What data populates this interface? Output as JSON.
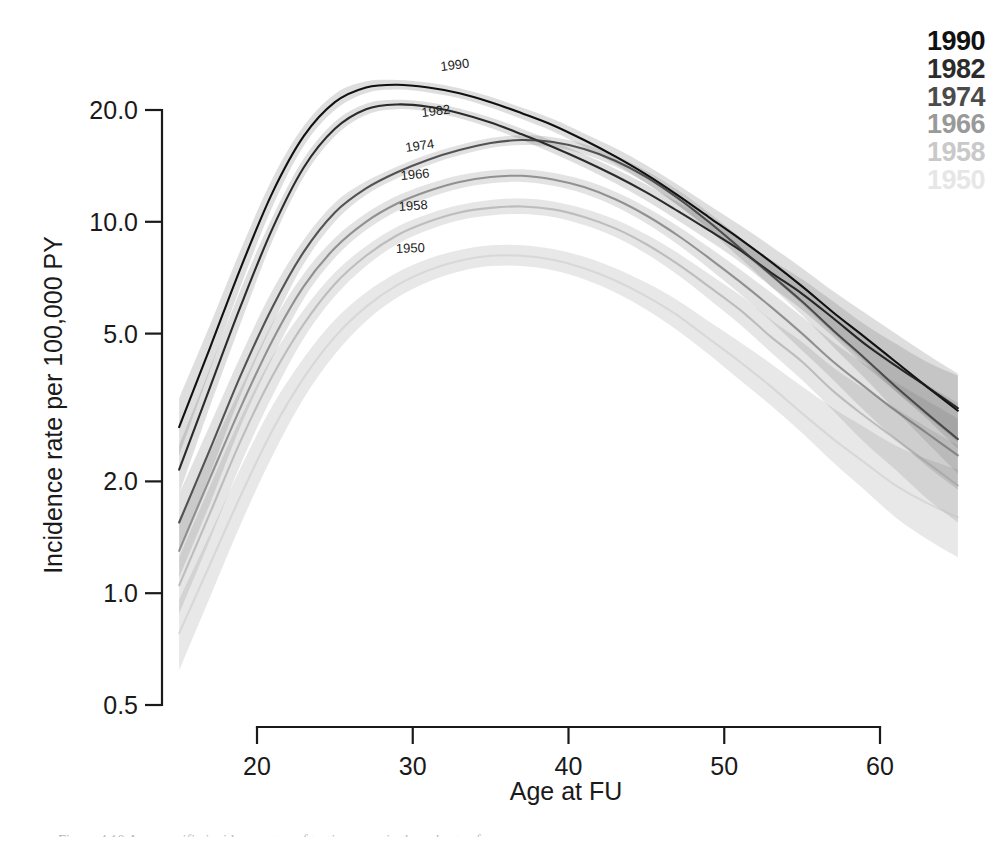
{
  "chart_data": {
    "type": "line",
    "title": "",
    "xlabel": "Age at FU",
    "ylabel": "Incidence rate per 100,000 PY",
    "yscale": "log",
    "xlim": [
      15,
      65
    ],
    "ylim": [
      0.5,
      26
    ],
    "grid": false,
    "legend_position": "top-right",
    "xticks": [
      20,
      30,
      40,
      50,
      60
    ],
    "xticklabels": [
      "20",
      "30",
      "40",
      "50",
      "60"
    ],
    "yticks": [
      0.5,
      1.0,
      2.0,
      5.0,
      10.0,
      20.0
    ],
    "yticklabels": [
      "0.5",
      "1.0",
      "2.0",
      "5.0",
      "10.0",
      "20.0"
    ],
    "band_description": "shaded grey 95% confidence bands around each curve",
    "series": [
      {
        "name": "1990",
        "color": "#111111",
        "opacity": 1.0,
        "x": [
          15,
          17,
          19,
          21,
          23,
          25,
          27,
          29,
          31,
          33,
          35,
          37,
          39,
          41,
          43,
          45,
          47,
          49,
          51,
          53,
          55,
          57,
          59,
          61,
          63,
          65
        ],
        "values": [
          2.8,
          4.6,
          7.6,
          12.0,
          17.0,
          21.0,
          23.0,
          23.4,
          23.0,
          22.2,
          21.0,
          19.6,
          18.2,
          16.6,
          15.0,
          13.4,
          11.8,
          10.3,
          9.0,
          7.8,
          6.7,
          5.7,
          4.9,
          4.2,
          3.6,
          3.1
        ],
        "ci_lower": [
          2.35,
          4.0,
          6.8,
          11.0,
          16.0,
          20.0,
          22.2,
          22.7,
          22.3,
          21.5,
          20.3,
          18.9,
          17.5,
          15.9,
          14.3,
          12.7,
          11.1,
          9.6,
          8.3,
          7.1,
          6.0,
          5.0,
          4.2,
          3.5,
          2.95,
          2.45
        ],
        "ci_upper": [
          3.35,
          5.3,
          8.5,
          13.1,
          18.1,
          22.1,
          23.9,
          24.1,
          23.7,
          22.9,
          21.7,
          20.3,
          18.9,
          17.3,
          15.8,
          14.2,
          12.6,
          11.1,
          9.8,
          8.6,
          7.5,
          6.5,
          5.7,
          5.0,
          4.4,
          3.9
        ]
      },
      {
        "name": "1982",
        "color": "#1b1b1b",
        "opacity": 0.92,
        "x": [
          15,
          17,
          19,
          21,
          23,
          25,
          27,
          29,
          31,
          33,
          35,
          37,
          39,
          41,
          43,
          45,
          47,
          49,
          51,
          53,
          55,
          57,
          59,
          61,
          63,
          65
        ],
        "values": [
          2.15,
          3.6,
          6.0,
          9.6,
          14.0,
          17.8,
          20.1,
          20.7,
          20.4,
          19.6,
          18.5,
          17.2,
          15.9,
          14.6,
          13.3,
          12.0,
          10.7,
          9.5,
          8.4,
          7.3,
          6.4,
          5.5,
          4.7,
          4.1,
          3.6,
          3.15
        ],
        "ci_lower": [
          1.85,
          3.2,
          5.4,
          8.9,
          13.2,
          17.0,
          19.4,
          20.1,
          19.8,
          19.0,
          17.9,
          16.6,
          15.3,
          14.0,
          12.7,
          11.4,
          10.1,
          8.9,
          7.8,
          6.7,
          5.8,
          4.9,
          4.1,
          3.5,
          3.0,
          2.55
        ],
        "ci_upper": [
          2.5,
          4.05,
          6.65,
          10.3,
          14.8,
          18.6,
          20.8,
          21.3,
          21.0,
          20.2,
          19.1,
          17.8,
          16.5,
          15.2,
          13.9,
          12.6,
          11.3,
          10.1,
          9.0,
          7.9,
          7.0,
          6.1,
          5.3,
          4.7,
          4.2,
          3.85
        ]
      },
      {
        "name": "1974",
        "color": "#3a3a3a",
        "opacity": 0.85,
        "x": [
          15,
          17,
          19,
          21,
          23,
          25,
          27,
          29,
          31,
          33,
          35,
          37,
          39,
          41,
          43,
          45,
          47,
          49,
          51,
          53,
          55,
          57,
          59,
          61,
          63,
          65
        ],
        "values": [
          1.55,
          2.45,
          3.9,
          5.9,
          8.3,
          10.6,
          12.3,
          13.6,
          14.7,
          15.6,
          16.3,
          16.6,
          16.4,
          15.7,
          14.6,
          13.2,
          11.6,
          10.0,
          8.5,
          7.2,
          6.1,
          5.1,
          4.3,
          3.6,
          3.05,
          2.6
        ],
        "ci_lower": [
          1.3,
          2.1,
          3.45,
          5.3,
          7.7,
          10.0,
          11.8,
          13.1,
          14.2,
          15.1,
          15.8,
          16.1,
          15.9,
          15.2,
          14.1,
          12.7,
          11.1,
          9.5,
          8.0,
          6.7,
          5.6,
          4.6,
          3.8,
          3.1,
          2.55,
          2.1
        ],
        "ci_upper": [
          1.85,
          2.85,
          4.4,
          6.55,
          8.95,
          11.25,
          12.85,
          14.1,
          15.2,
          16.1,
          16.8,
          17.1,
          16.9,
          16.2,
          15.1,
          13.7,
          12.2,
          10.6,
          9.1,
          7.8,
          6.7,
          5.7,
          4.9,
          4.2,
          3.65,
          3.25
        ]
      },
      {
        "name": "1966",
        "color": "#6e6e6e",
        "opacity": 0.7,
        "x": [
          15,
          17,
          19,
          21,
          23,
          25,
          27,
          29,
          31,
          33,
          35,
          37,
          39,
          41,
          43,
          45,
          47,
          49,
          51,
          53,
          55,
          57,
          59,
          61,
          63,
          65
        ],
        "values": [
          1.3,
          2.05,
          3.2,
          4.8,
          6.7,
          8.5,
          10.0,
          11.2,
          12.1,
          12.8,
          13.2,
          13.3,
          13.0,
          12.4,
          11.5,
          10.4,
          9.2,
          8.0,
          6.9,
          5.9,
          5.0,
          4.2,
          3.6,
          3.1,
          2.7,
          2.35
        ],
        "ci_lower": [
          1.1,
          1.75,
          2.85,
          4.3,
          6.2,
          8.0,
          9.5,
          10.7,
          11.6,
          12.3,
          12.7,
          12.8,
          12.5,
          11.9,
          11.0,
          9.9,
          8.7,
          7.5,
          6.4,
          5.4,
          4.5,
          3.75,
          3.1,
          2.6,
          2.2,
          1.9
        ],
        "ci_upper": [
          1.55,
          2.4,
          3.6,
          5.35,
          7.25,
          9.05,
          10.55,
          11.75,
          12.65,
          13.35,
          13.75,
          13.85,
          13.55,
          12.95,
          12.05,
          10.95,
          9.75,
          8.55,
          7.45,
          6.45,
          5.55,
          4.75,
          4.15,
          3.7,
          3.3,
          2.95
        ]
      },
      {
        "name": "1958",
        "color": "#9a9a9a",
        "opacity": 0.55,
        "x": [
          15,
          17,
          19,
          21,
          23,
          25,
          27,
          29,
          31,
          33,
          35,
          37,
          39,
          41,
          43,
          45,
          47,
          49,
          51,
          53,
          55,
          57,
          59,
          61,
          63,
          65
        ],
        "values": [
          1.05,
          1.65,
          2.6,
          3.85,
          5.3,
          6.8,
          8.1,
          9.2,
          10.0,
          10.6,
          10.9,
          11.0,
          10.8,
          10.3,
          9.6,
          8.7,
          7.7,
          6.7,
          5.8,
          4.9,
          4.2,
          3.5,
          3.0,
          2.6,
          2.25,
          1.95
        ],
        "ci_lower": [
          0.88,
          1.4,
          2.25,
          3.4,
          4.85,
          6.3,
          7.6,
          8.7,
          9.5,
          10.1,
          10.4,
          10.5,
          10.3,
          9.8,
          9.1,
          8.2,
          7.2,
          6.2,
          5.3,
          4.45,
          3.75,
          3.1,
          2.55,
          2.15,
          1.8,
          1.55
        ],
        "ci_upper": [
          1.25,
          1.95,
          3.0,
          4.35,
          5.8,
          7.3,
          8.6,
          9.7,
          10.5,
          11.1,
          11.45,
          11.55,
          11.35,
          10.85,
          10.15,
          9.25,
          8.25,
          7.25,
          6.35,
          5.45,
          4.75,
          4.05,
          3.55,
          3.15,
          2.8,
          2.5
        ]
      },
      {
        "name": "1950",
        "color": "#c2c2c2",
        "opacity": 0.42,
        "x": [
          15,
          17,
          19,
          21,
          23,
          25,
          27,
          29,
          31,
          33,
          35,
          37,
          39,
          41,
          43,
          45,
          47,
          49,
          51,
          53,
          55,
          57,
          59,
          61,
          63,
          65
        ],
        "values": [
          0.78,
          1.2,
          1.85,
          2.75,
          3.8,
          4.9,
          5.9,
          6.75,
          7.4,
          7.85,
          8.1,
          8.1,
          7.9,
          7.5,
          6.95,
          6.3,
          5.6,
          4.85,
          4.2,
          3.6,
          3.05,
          2.6,
          2.25,
          1.95,
          1.75,
          1.6
        ],
        "ci_lower": [
          0.62,
          0.98,
          1.55,
          2.35,
          3.35,
          4.4,
          5.4,
          6.25,
          6.9,
          7.35,
          7.6,
          7.6,
          7.4,
          7.0,
          6.45,
          5.8,
          5.1,
          4.4,
          3.75,
          3.2,
          2.7,
          2.25,
          1.9,
          1.6,
          1.4,
          1.25
        ],
        "ci_upper": [
          0.96,
          1.45,
          2.2,
          3.2,
          4.3,
          5.45,
          6.45,
          7.3,
          7.95,
          8.4,
          8.65,
          8.65,
          8.45,
          8.05,
          7.5,
          6.85,
          6.15,
          5.4,
          4.75,
          4.15,
          3.6,
          3.15,
          2.8,
          2.5,
          2.3,
          2.15
        ]
      }
    ],
    "inline_annotations": [
      {
        "text": "1990",
        "x_px": 441,
        "y_px": 71,
        "rotation": -7
      },
      {
        "text": "1982",
        "x_px": 422,
        "y_px": 117,
        "rotation": -7
      },
      {
        "text": "1974",
        "x_px": 406,
        "y_px": 152,
        "rotation": -8
      },
      {
        "text": "1966",
        "x_px": 401,
        "y_px": 180,
        "rotation": -5
      },
      {
        "text": "1958",
        "x_px": 399,
        "y_px": 211,
        "rotation": -4
      },
      {
        "text": "1950",
        "x_px": 396,
        "y_px": 253,
        "rotation": -2
      }
    ]
  },
  "legend": {
    "items": [
      {
        "label": "1990",
        "color": "#111111",
        "opacity": 1.0
      },
      {
        "label": "1982",
        "color": "#1b1b1b",
        "opacity": 0.93
      },
      {
        "label": "1974",
        "color": "#333333",
        "opacity": 0.88
      },
      {
        "label": "1966",
        "color": "#737373",
        "opacity": 0.72
      },
      {
        "label": "1958",
        "color": "#a6a6a6",
        "opacity": 0.6
      },
      {
        "label": "1950",
        "color": "#cfcfcf",
        "opacity": 0.5
      }
    ]
  },
  "caption": {
    "text": "Figure 4.10 Age-specific incidence rates of testis cancer in the cohorts of men ...",
    "visible": false
  }
}
